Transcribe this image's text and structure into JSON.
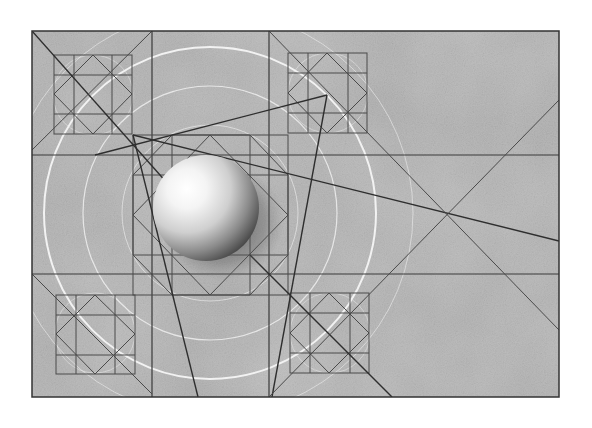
{
  "image": {
    "description": "Geometric construction study: a shaded white sphere centered in a 3x3 grid with diagonal construction lines, inscribed square-and-diamond motifs, and concentric white arcs on a textured gray background",
    "colors": {
      "background": "#ffffff",
      "paper": "#b3b3b3",
      "paper_light": "#c4c4c4",
      "line_dark": "#2e2e2e",
      "line_mid": "#555555",
      "arc_white": "#f2f2f2",
      "sphere_highlight": "#ffffff",
      "sphere_shadow": "#5a5a5a"
    }
  }
}
